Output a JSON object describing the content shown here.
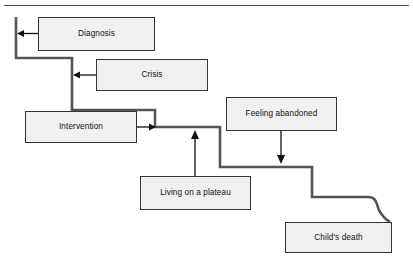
{
  "diagram": {
    "title_visible": false,
    "type": "staircase-flow-diagram",
    "border": {
      "top_line_color": "#4a4a4a"
    },
    "style": {
      "box_fill": "#f0f0f0",
      "box_border": "#333333",
      "stair_line_color": "#555555",
      "arrow_color": "#111111"
    },
    "nodes": [
      {
        "id": "diagnosis",
        "label": "Diagnosis",
        "x": 38,
        "y": 17,
        "w": 117,
        "h": 34
      },
      {
        "id": "crisis",
        "label": "Crisis",
        "x": 96,
        "y": 59,
        "w": 112,
        "h": 32
      },
      {
        "id": "intervention",
        "label": "Intervention",
        "x": 25,
        "y": 111,
        "w": 112,
        "h": 32
      },
      {
        "id": "feeling-abandoned",
        "label": "Feeling abandoned",
        "x": 226,
        "y": 97,
        "w": 111,
        "h": 34
      },
      {
        "id": "living-on-a-plateau",
        "label": "Living on a plateau",
        "x": 140,
        "y": 176,
        "w": 111,
        "h": 34
      },
      {
        "id": "childs-death",
        "label": "Child's death",
        "x": 285,
        "y": 222,
        "w": 107,
        "h": 31
      }
    ],
    "connectors": [
      {
        "id": "diagnosis-to-stair",
        "from": "diagnosis",
        "to": "staircase",
        "direction": "left",
        "arrowhead": "left"
      },
      {
        "id": "crisis-to-stair",
        "from": "crisis",
        "to": "staircase",
        "direction": "left",
        "arrowhead": "left"
      },
      {
        "id": "intervention-to-stair",
        "from": "intervention",
        "to": "staircase",
        "direction": "right",
        "arrowhead": "right"
      },
      {
        "id": "plateau-to-stair",
        "from": "living-on-a-plateau",
        "to": "staircase",
        "direction": "up",
        "arrowhead": "up"
      },
      {
        "id": "abandoned-to-stair",
        "from": "feeling-abandoned",
        "to": "staircase",
        "direction": "down",
        "arrowhead": "down"
      },
      {
        "id": "stair-to-childs-death",
        "from": "staircase",
        "to": "childs-death",
        "direction": "curve",
        "arrowhead": "none"
      }
    ],
    "staircase": {
      "description": "descending step line from upper-left to lower-right",
      "points": "16,17 16,58 72,58 72,110 155,110 155,127 220,127 220,167 312,167 312,197 372,197"
    }
  }
}
